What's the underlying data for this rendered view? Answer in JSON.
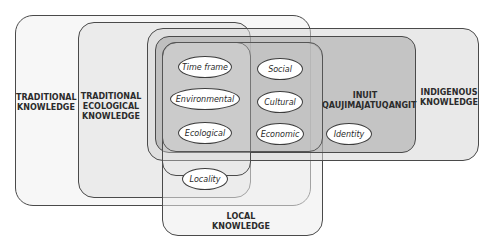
{
  "diagram": {
    "regions": {
      "traditional_knowledge": "TRADITIONAL\nKNOWLEDGE",
      "traditional_ecological_knowledge": "TRADITIONAL\nECOLOGICAL\nKNOWLEDGE",
      "inuit_qaujimajatuqangit": "INUIT\nQAUJIMAJATUQANGIT",
      "indigenous_knowledge": "INDIGENOUS\nKNOWLEDGE",
      "local_knowledge": "LOCAL\nKNOWLEDGE"
    },
    "attributes": {
      "time_frame": "Time frame",
      "environmental": "Environmental",
      "ecological": "Ecological",
      "social": "Social",
      "cultural": "Cultural",
      "economic": "Economic",
      "identity": "Identity",
      "locality": "Locality"
    },
    "colors": {
      "traditional_knowledge_fill": "#f6f6f6",
      "tek_fill": "#ececec",
      "indigenous_fill": "#e4e4e4",
      "inuit_fill": "#b8b8b8",
      "local_fill": "#eeeeee",
      "core_fill": "#d6d6d6",
      "outline": "#4a4a4a"
    }
  }
}
